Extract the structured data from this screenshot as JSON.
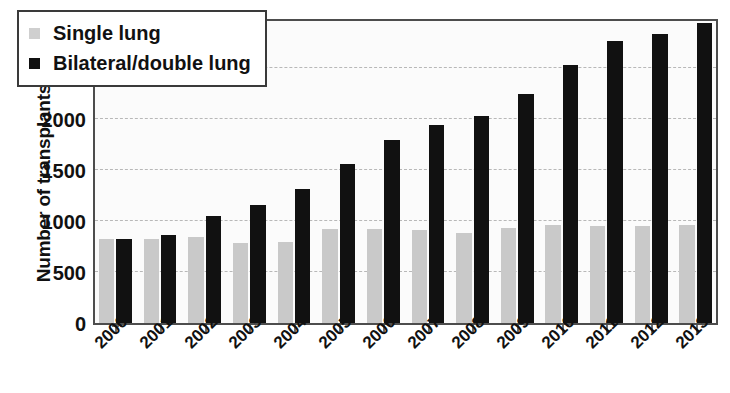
{
  "chart_data": {
    "type": "bar",
    "title": "",
    "xlabel": "",
    "ylabel": "Number of transplants",
    "ylim": [
      0,
      3000
    ],
    "yticks": [
      0,
      500,
      1000,
      1500,
      2000,
      2500,
      3000
    ],
    "grid": true,
    "legend_position": "top-left",
    "categories": [
      "2000",
      "2001",
      "2002",
      "2003",
      "2004",
      "2005",
      "2006",
      "2007",
      "2008",
      "2009",
      "2010",
      "2011",
      "2012",
      "2013"
    ],
    "series": [
      {
        "name": "Single lung",
        "color": "#c9c9c9",
        "values": [
          820,
          820,
          840,
          780,
          790,
          920,
          920,
          910,
          880,
          930,
          960,
          950,
          950,
          960
        ]
      },
      {
        "name": "Bilateral/double lung",
        "color": "#111111",
        "values": [
          820,
          860,
          1050,
          1160,
          1310,
          1555,
          1790,
          1940,
          2030,
          2250,
          2530,
          2760,
          2830,
          2940
        ]
      }
    ]
  },
  "legend": {
    "items": [
      {
        "label": "Single lung",
        "swatch": "legend-swatch-single-lung"
      },
      {
        "label": "Bilateral/double lung",
        "swatch": "legend-swatch-bilateral-double-lung"
      }
    ]
  },
  "axes": {
    "y_title": "Number of transplants",
    "y_tick_labels": [
      "3000",
      "2500",
      "2000",
      "1500",
      "1000",
      "500",
      "0"
    ],
    "x_tick_labels": [
      "2000",
      "2001",
      "2002",
      "2003",
      "2004",
      "2005",
      "2006",
      "2007",
      "2008",
      "2009",
      "2010",
      "2011",
      "2012",
      "2013"
    ]
  }
}
